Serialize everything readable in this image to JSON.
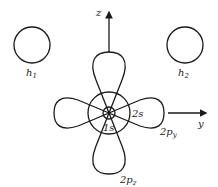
{
  "diagram": {
    "axes": {
      "vertical": "z",
      "horizontal": "y"
    },
    "hydrogens": [
      {
        "label_main": "h",
        "label_sub": "1"
      },
      {
        "label_main": "h",
        "label_sub": "2"
      }
    ],
    "orbitals": {
      "s1": {
        "main": "1s"
      },
      "s2": {
        "main": "2s"
      },
      "py": {
        "main": "2p",
        "sub": "y"
      },
      "pz": {
        "main": "2p",
        "sub": "z"
      }
    },
    "colors": {
      "stroke": "#1a1a1a",
      "background": "#ffffff"
    }
  }
}
